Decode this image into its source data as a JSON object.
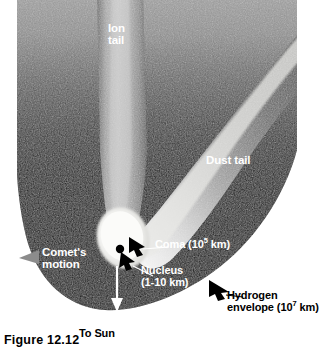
{
  "figure": {
    "caption": "Figure 12.12"
  },
  "labels": {
    "ion_tail": "Ion\ntail",
    "dust_tail": "Dust tail",
    "comets_motion": "Comet's\nmotion",
    "coma_pre": "Coma (10",
    "coma_exp": "5",
    "coma_post": " km)",
    "nucleus_line1": "Nucleus",
    "nucleus_line2": "(1-10 km)",
    "hydrogen_line1": "Hydrogen",
    "hydrogen_pre": "envelope (10",
    "hydrogen_exp": "7",
    "hydrogen_post": " km)",
    "to_sun": "To Sun"
  },
  "colors": {
    "page_background": "#ffffff",
    "envelope_dark": "#000000",
    "tail_light": "#e8e8e8",
    "tail_mid": "#9a9a9a",
    "tail_dark": "#2a2a2a",
    "coma_white": "#f4f4f2",
    "nucleus_black": "#000000",
    "motion_arrow": "#8c8c8c",
    "label_white": "#ffffff",
    "label_black": "#000000"
  },
  "icons": {
    "comets_motion_arrow": "triangle-left-icon",
    "to_sun_arrow": "arrow-down-icon",
    "coma_pointer": "arrow-pointer-icon",
    "nucleus_pointer": "arrow-pointer-icon",
    "hydrogen_pointer": "arrow-pointer-icon",
    "nucleus_leader": "leader-line-icon",
    "coma_leader": "leader-line-icon",
    "hydrogen_leader": "leader-line-icon"
  },
  "scale_annotations": {
    "coma_size": "10^5 km",
    "nucleus_size": "1-10 km",
    "hydrogen_envelope_size": "10^7 km"
  }
}
